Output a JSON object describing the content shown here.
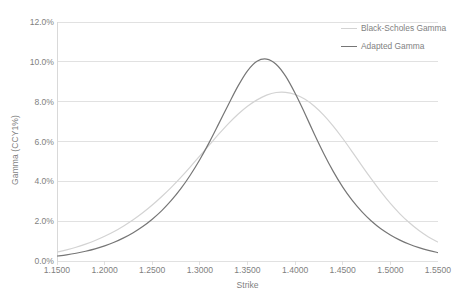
{
  "chart_data": {
    "type": "line",
    "title": "",
    "xlabel": "Strike",
    "ylabel": "Gamma (CCY1%)",
    "xlim": [
      1.15,
      1.55
    ],
    "ylim": [
      0.0,
      12.0
    ],
    "grid": true,
    "legend_position": "top-right",
    "x_tick_labels": [
      "1.1500",
      "1.2000",
      "1.2500",
      "1.3000",
      "1.3500",
      "1.4000",
      "1.4500",
      "1.5000",
      "1.5500"
    ],
    "x_ticks": [
      1.15,
      1.2,
      1.25,
      1.3,
      1.35,
      1.4,
      1.45,
      1.5,
      1.55
    ],
    "y_tick_labels": [
      "0.0%",
      "2.0%",
      "4.0%",
      "6.0%",
      "8.0%",
      "10.0%",
      "12.0%"
    ],
    "y_ticks": [
      0.0,
      2.0,
      4.0,
      6.0,
      8.0,
      10.0,
      12.0
    ],
    "x": [
      1.15,
      1.16,
      1.17,
      1.18,
      1.19,
      1.2,
      1.21,
      1.22,
      1.23,
      1.24,
      1.25,
      1.26,
      1.27,
      1.28,
      1.29,
      1.3,
      1.31,
      1.32,
      1.33,
      1.34,
      1.35,
      1.36,
      1.37,
      1.38,
      1.39,
      1.4,
      1.41,
      1.42,
      1.43,
      1.44,
      1.45,
      1.46,
      1.47,
      1.48,
      1.49,
      1.5,
      1.51,
      1.52,
      1.53,
      1.54,
      1.55
    ],
    "series": [
      {
        "name": "Black-Scholes Gamma",
        "color": "#d3d3d3",
        "values": [
          0.45,
          0.56,
          0.69,
          0.85,
          1.03,
          1.24,
          1.48,
          1.76,
          2.07,
          2.42,
          2.81,
          3.24,
          3.7,
          4.2,
          4.73,
          5.28,
          5.83,
          6.38,
          6.9,
          7.37,
          7.77,
          8.09,
          8.33,
          8.46,
          8.47,
          8.36,
          8.13,
          7.78,
          7.32,
          6.77,
          6.15,
          5.48,
          4.79,
          4.12,
          3.48,
          2.89,
          2.37,
          1.92,
          1.53,
          1.21,
          0.95
        ]
      },
      {
        "name": "Adapted Gamma",
        "color": "#767676",
        "values": [
          0.25,
          0.31,
          0.39,
          0.49,
          0.61,
          0.76,
          0.94,
          1.16,
          1.42,
          1.73,
          2.1,
          2.53,
          3.04,
          3.63,
          4.32,
          5.1,
          5.97,
          6.91,
          7.86,
          8.78,
          9.55,
          10.03,
          10.14,
          9.88,
          9.28,
          8.42,
          7.43,
          6.39,
          5.4,
          4.5,
          3.71,
          3.04,
          2.48,
          2.01,
          1.62,
          1.31,
          1.05,
          0.84,
          0.67,
          0.53,
          0.42
        ]
      }
    ]
  },
  "legend": {
    "items": [
      {
        "label": "Black-Scholes Gamma",
        "color": "#d3d3d3"
      },
      {
        "label": "Adapted Gamma",
        "color": "#767676"
      }
    ]
  },
  "axes": {
    "x_title": "Strike",
    "y_title": "Gamma (CCY1%)"
  },
  "style": {
    "background": "#ffffff",
    "gridline_color": "#d9d9d9",
    "axis_line_color": "#d9d9d9",
    "text_color": "#7f7f7f"
  }
}
